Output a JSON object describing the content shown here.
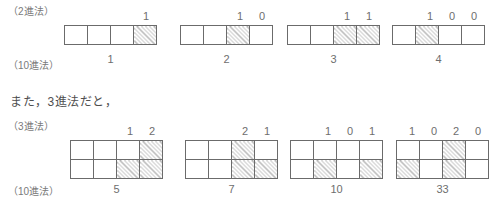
{
  "figure": {
    "note_text": "また，3進法だと，",
    "sections": [
      {
        "id": "binary",
        "base_label": "（2進法）",
        "decimal_label": "（10進法）",
        "rows": 1,
        "cols": 4,
        "groups": [
          {
            "digits": [
              "1"
            ],
            "decimal": "1",
            "cells": [
              [
                "empty",
                "empty",
                "empty",
                "hatch"
              ]
            ]
          },
          {
            "digits": [
              "1",
              "0"
            ],
            "decimal": "2",
            "cells": [
              [
                "empty",
                "empty",
                "hatch",
                "empty"
              ]
            ]
          },
          {
            "digits": [
              "1",
              "1"
            ],
            "decimal": "3",
            "cells": [
              [
                "empty",
                "empty",
                "hatch",
                "hatch"
              ]
            ]
          },
          {
            "digits": [
              "1",
              "0",
              "0"
            ],
            "decimal": "4",
            "cells": [
              [
                "empty",
                "hatch",
                "empty",
                "empty"
              ]
            ]
          }
        ]
      },
      {
        "id": "ternary",
        "base_label": "（3進法）",
        "decimal_label": "（10進法）",
        "rows": 2,
        "cols": 4,
        "groups": [
          {
            "digits": [
              "1",
              "2"
            ],
            "decimal": "5",
            "cells": [
              [
                "empty",
                "empty",
                "empty",
                "hatch"
              ],
              [
                "empty",
                "empty",
                "hatch",
                "hatch"
              ]
            ]
          },
          {
            "digits": [
              "2",
              "1"
            ],
            "decimal": "7",
            "cells": [
              [
                "empty",
                "empty",
                "hatch",
                "empty"
              ],
              [
                "empty",
                "empty",
                "hatch",
                "hatch"
              ]
            ]
          },
          {
            "digits": [
              "1",
              "0",
              "1"
            ],
            "decimal": "10",
            "cells": [
              [
                "empty",
                "empty",
                "empty",
                "empty"
              ],
              [
                "empty",
                "hatch",
                "empty",
                "hatch"
              ]
            ]
          },
          {
            "digits": [
              "1",
              "0",
              "2",
              "0"
            ],
            "decimal": "33",
            "cells": [
              [
                "empty",
                "empty",
                "hatch",
                "empty"
              ],
              [
                "hatch",
                "empty",
                "hatch",
                "empty"
              ]
            ]
          }
        ]
      }
    ]
  },
  "colors": {
    "ink": "#6e6e6e",
    "cell_border": "#6b6b6b",
    "hatch": "#b4b4b4",
    "background": "#ffffff"
  }
}
